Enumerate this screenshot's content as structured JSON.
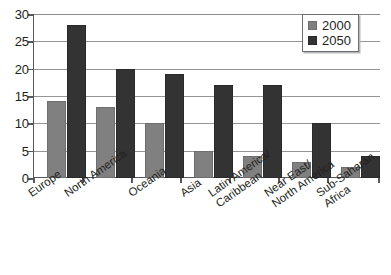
{
  "chart_data": {
    "type": "bar",
    "title": "",
    "subtitle": "",
    "xlabel": "",
    "ylabel": "",
    "ylim": [
      0,
      30
    ],
    "yticks": [
      0,
      5,
      10,
      15,
      20,
      25,
      30
    ],
    "grid": true,
    "legend_position": "top-right",
    "categories": [
      "Europe",
      "North America",
      "Oceania",
      "Asia",
      "Latin America/ Caribbean",
      "Near East/ North America",
      "Sub-Saharan Africa"
    ],
    "category_lines": [
      [
        "Europe",
        ""
      ],
      [
        "North America",
        ""
      ],
      [
        "Oceania",
        ""
      ],
      [
        "Asia",
        ""
      ],
      [
        "Latin America/",
        "Caribbean"
      ],
      [
        "Near East/",
        "North America"
      ],
      [
        "Sub-Saharan",
        "Africa"
      ]
    ],
    "series": [
      {
        "name": "2000",
        "color": "#808080",
        "values": [
          14,
          13,
          10,
          5,
          4,
          3,
          2
        ]
      },
      {
        "name": "2050",
        "color": "#333333",
        "values": [
          28,
          20,
          19,
          17,
          17,
          10,
          4
        ]
      }
    ]
  },
  "legend": {
    "entries": [
      {
        "label": "2000",
        "color": "#808080"
      },
      {
        "label": "2050",
        "color": "#333333"
      }
    ]
  },
  "axis": {
    "y_tick_labels": [
      "30",
      "25",
      "20",
      "15",
      "10",
      "5",
      "0"
    ]
  }
}
